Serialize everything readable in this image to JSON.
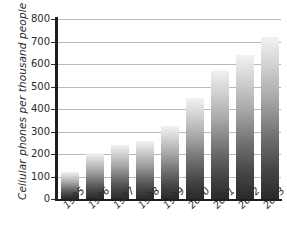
{
  "chart_data": {
    "type": "bar",
    "title": "",
    "xlabel": "",
    "ylabel": "Cellular phones per thousand people",
    "categories": [
      "1995",
      "1996",
      "1997",
      "1998",
      "1999",
      "2000",
      "2001",
      "2002",
      "2003"
    ],
    "values": [
      120,
      205,
      240,
      260,
      325,
      450,
      575,
      640,
      720
    ],
    "ylim": [
      0,
      800
    ],
    "yticks": [
      0,
      100,
      200,
      300,
      400,
      500,
      600,
      700,
      800
    ],
    "ytick_labels": [
      "0",
      "100",
      "200",
      "300",
      "400",
      "500",
      "600",
      "700",
      "800"
    ],
    "grid": true,
    "legend": null,
    "legend_position": "none",
    "series": [
      {
        "name": "Cellular phones per thousand people",
        "values": [
          120,
          205,
          240,
          260,
          325,
          450,
          575,
          640,
          720
        ]
      }
    ],
    "colors": {
      "bar_top": "#f2f2f2",
      "bar_bottom": "#2a2a2a",
      "gridline": "#b9b9b9",
      "axis": "#1e1e1e",
      "text": "#2b2b2b",
      "background": "#ffffff"
    }
  }
}
